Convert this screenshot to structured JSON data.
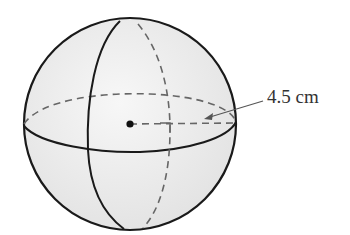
{
  "figure": {
    "type": "sphere",
    "radius_label": "4.5 cm",
    "colors": {
      "fill": "#ececec",
      "stroke": "#1a1a1a",
      "dashed": "#666666",
      "arrow": "#555555",
      "text": "#333333"
    }
  }
}
